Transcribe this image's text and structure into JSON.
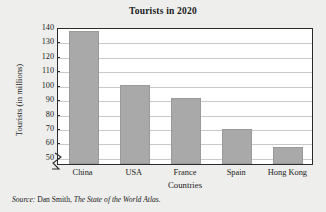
{
  "chart_data": {
    "type": "bar",
    "title": "Tourists in 2020",
    "xlabel": "Countries",
    "ylabel": "Tourists (in millions)",
    "categories": [
      "China",
      "USA",
      "France",
      "Spain",
      "Hong Kong"
    ],
    "values": [
      137,
      100,
      91,
      69,
      57
    ],
    "yticks": [
      50,
      60,
      70,
      80,
      90,
      100,
      110,
      120,
      130,
      140
    ],
    "ylim": [
      45,
      140
    ],
    "axis_break": true,
    "grid": true,
    "legend": false,
    "bar_color": "#a9a9a9",
    "frame_color": "#2b2b2b",
    "plot_background": "#ffffff",
    "figure_background": "#eeeeec"
  },
  "source": {
    "prefix": "Source:",
    "author": " Dan Smith, ",
    "work": "The State of the World Atlas."
  }
}
